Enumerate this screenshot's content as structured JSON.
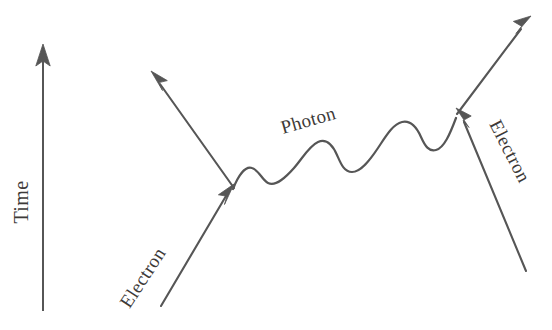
{
  "figure": {
    "kind": "feynman-diagram",
    "background_color": "#ffffff",
    "stroke_color": "#565656",
    "label_color": "#3d3a38",
    "width": 552,
    "height": 330
  },
  "axis": {
    "label": "Time",
    "direction": "upward",
    "rotation_deg": -90,
    "label_x": 28,
    "label_y": 202
  },
  "labels": {
    "photon": "Photon",
    "electron_in": "Electron",
    "electron_out": "Electron"
  },
  "particles": [
    {
      "name": "incoming-electron-left",
      "label": "Electron",
      "type": "fermion",
      "label_rotation_deg": -57,
      "label_x": 148,
      "label_y": 281
    },
    {
      "name": "photon-exchange",
      "label": "Photon",
      "type": "boson",
      "label_rotation_deg": -16,
      "label_x": 283,
      "label_y": 134
    },
    {
      "name": "incoming-electron-right",
      "label": "Electron",
      "type": "fermion",
      "label_rotation_deg": 63,
      "label_x": 489,
      "label_y": 124
    }
  ]
}
